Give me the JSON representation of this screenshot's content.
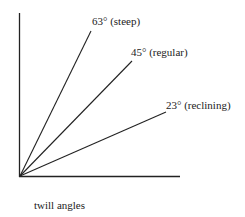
{
  "diagram": {
    "caption": "twill angles",
    "line_color": "#222222",
    "lines": [
      {
        "angle_deg": 63,
        "label": "63° (steep)"
      },
      {
        "angle_deg": 45,
        "label": "45° (regular)"
      },
      {
        "angle_deg": 23,
        "label": "23° (reclining)"
      }
    ]
  }
}
